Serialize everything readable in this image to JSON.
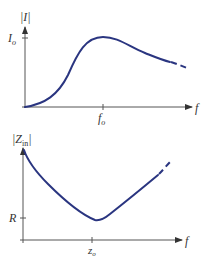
{
  "figure": {
    "top_plot": {
      "ylabel": "|I|",
      "xlabel": "f",
      "y_tick_label": "I",
      "y_tick_sub": "o",
      "x_tick_label": "f",
      "x_tick_sub": "o",
      "curve_description": "Resonance current magnitude: rises from zero to peak I_o at f_o, then decays; dashed continuation"
    },
    "bottom_plot": {
      "ylabel": "|Z",
      "ylabel_sub": "in",
      "ylabel_close": "|",
      "xlabel": "f",
      "y_tick_label": "R",
      "x_tick_label": "z",
      "x_tick_sub": "o",
      "curve_description": "Input impedance magnitude: decreases to minimum R at z_o, then rises; dashed continuation"
    },
    "colors": {
      "curve": "#2a3580",
      "axis": "#555555",
      "text": "#333333"
    }
  }
}
